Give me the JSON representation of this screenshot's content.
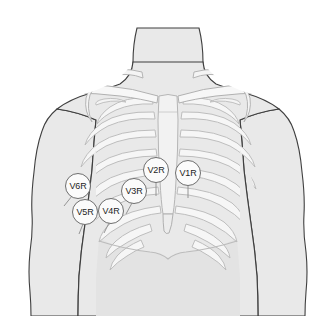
{
  "figure": {
    "name": "right-sided-chest-lead-placement",
    "background_color": "#ffffff"
  },
  "anatomy": {
    "body_fill": "#e9e9e9",
    "body_outline": "#444444",
    "bone_fill": "#f5f5f5",
    "bone_outline": "#b0b0b0",
    "abdomen_fill": "#e3e3e3",
    "parts": [
      {
        "name": "neck",
        "label": "Neck"
      },
      {
        "name": "left-shoulder",
        "label": "Shoulder"
      },
      {
        "name": "right-shoulder",
        "label": "Shoulder"
      },
      {
        "name": "left-arm",
        "label": "Upper arm"
      },
      {
        "name": "right-arm",
        "label": "Upper arm"
      },
      {
        "name": "clavicle-left",
        "label": "Clavicle"
      },
      {
        "name": "clavicle-right",
        "label": "Clavicle"
      },
      {
        "name": "sternum",
        "label": "Sternum"
      },
      {
        "name": "xiphoid-process",
        "label": "Xiphoid process"
      },
      {
        "name": "rib-cage",
        "label": "Rib cage"
      },
      {
        "name": "costal-margin",
        "label": "Costal margin"
      }
    ]
  },
  "electrodes": {
    "marker_fill": "#fbfbfb",
    "marker_outline": "#6e6e6e",
    "text_color": "#1d1d1d",
    "items": [
      {
        "id": "v1r",
        "label": "V1R",
        "x": 188,
        "y": 173
      },
      {
        "id": "v2r",
        "label": "V2R",
        "x": 156,
        "y": 170
      },
      {
        "id": "v3r",
        "label": "V3R",
        "x": 134,
        "y": 191
      },
      {
        "id": "v4r",
        "label": "V4R",
        "x": 111,
        "y": 211
      },
      {
        "id": "v5r",
        "label": "V5R",
        "x": 85,
        "y": 212
      },
      {
        "id": "v6r",
        "label": "V6R",
        "x": 78,
        "y": 186
      }
    ]
  }
}
